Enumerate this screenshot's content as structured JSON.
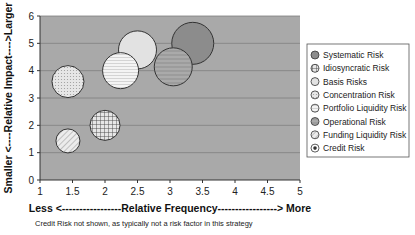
{
  "chart_data": {
    "type": "scatter",
    "subtype": "bubble",
    "title": "",
    "xlabel": "Less <-----------------Relative Frequency-----------------> More",
    "ylabel": "Smaller <----Relative Impact---->Larger",
    "xlim": [
      1,
      5
    ],
    "ylim": [
      0,
      6
    ],
    "xticks": [
      "1",
      "1.5",
      "2",
      "2.5",
      "3",
      "3.5",
      "4",
      "4.5",
      "5"
    ],
    "yticks": [
      "0",
      "1",
      "2",
      "3",
      "4",
      "5",
      "6"
    ],
    "grid": "horizontal",
    "legend_position": "right",
    "series": [
      {
        "name": "Systematic Risk",
        "x": 3.35,
        "y": 5.0,
        "size": 21,
        "pattern": "solid-dark"
      },
      {
        "name": "Idiosyncratic Risk",
        "x": 2.0,
        "y": 2.0,
        "size": 15,
        "pattern": "crosshatch"
      },
      {
        "name": "Basis Risks",
        "x": 2.5,
        "y": 4.76,
        "size": 19,
        "pattern": "solid-light"
      },
      {
        "name": "Concentration Risk",
        "x": 1.43,
        "y": 3.6,
        "size": 16,
        "pattern": "dots"
      },
      {
        "name": "Portfolio Liquidity Risk",
        "x": 2.24,
        "y": 4.0,
        "size": 18,
        "pattern": "hstripe-light"
      },
      {
        "name": "Operational Risk",
        "x": 3.05,
        "y": 4.14,
        "size": 19,
        "pattern": "hstripe-dark"
      },
      {
        "name": "Funding Liquidity Risk",
        "x": 1.43,
        "y": 1.43,
        "size": 12,
        "pattern": "diagonal"
      },
      {
        "name": "Credit Risk",
        "x": null,
        "y": null,
        "size": null,
        "pattern": "credit"
      }
    ],
    "footnote": "Credit Risk not shown, as typically not a risk factor in this strategy"
  },
  "colors": {
    "plot_bg": "#a9a9a9",
    "gridline": "#7f7f7f",
    "outline": "#333333"
  }
}
